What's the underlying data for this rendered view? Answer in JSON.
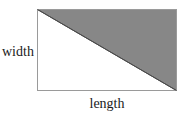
{
  "figure": {
    "type": "geometry-diagram",
    "background_color": "#ffffff",
    "rectangle": {
      "name": "rectangle",
      "x": 37,
      "y": 9,
      "width": 140,
      "height": 82,
      "stroke_color": "#999999",
      "stroke_width": 1,
      "fill_color": "#ffffff"
    },
    "shaded_triangle": {
      "name": "shaded-upper-right-triangle",
      "points": "37,9 177,9 177,91",
      "fill_color": "#878787",
      "stroke_color": "#4a4a4a",
      "stroke_width": 1
    },
    "diagonal": {
      "name": "diagonal-line",
      "x1": 37,
      "y1": 9,
      "x2": 177,
      "y2": 91,
      "stroke_color": "#4a4a4a",
      "stroke_width": 1
    },
    "labels": {
      "width": "width",
      "length": "length"
    },
    "label_color": "#1a1a1a"
  }
}
